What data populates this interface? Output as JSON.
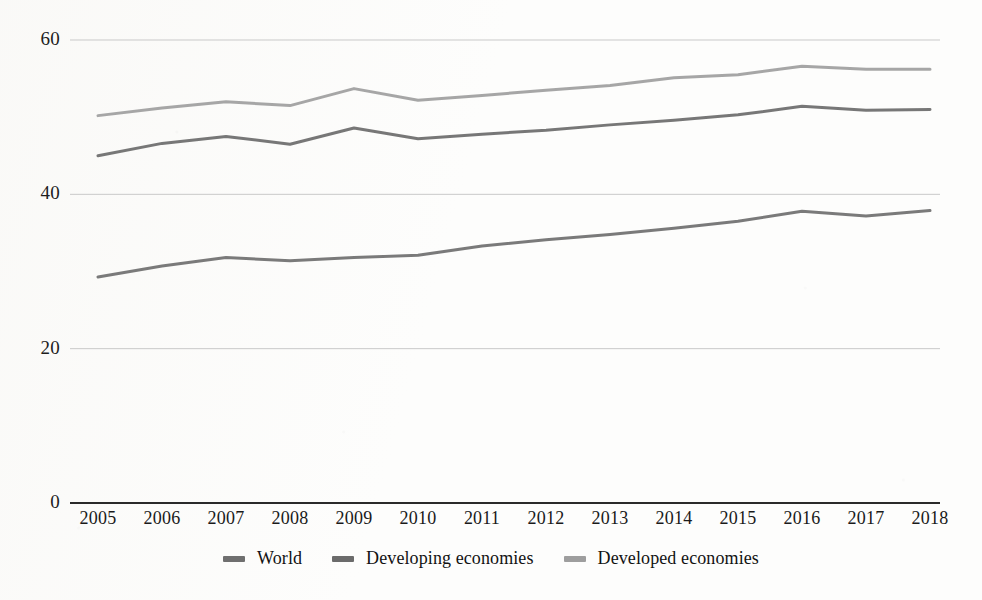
{
  "chart_data": {
    "type": "line",
    "title": "",
    "subtitle": "",
    "xlabel": "",
    "ylabel": "",
    "categories": [
      "2005",
      "2006",
      "2007",
      "2008",
      "2009",
      "2010",
      "2011",
      "2012",
      "2013",
      "2014",
      "2015",
      "2016",
      "2017",
      "2018"
    ],
    "ylim": [
      0,
      60
    ],
    "yticks": [
      0,
      20,
      40,
      60
    ],
    "ytick_labels": [
      "0",
      "20",
      "40",
      "60"
    ],
    "grid": true,
    "grid_axis": "y",
    "legend_position": "bottom",
    "series": [
      {
        "name": "World",
        "color": "#6f6f6f",
        "values": [
          29.3,
          30.7,
          31.8,
          31.4,
          31.8,
          32.1,
          33.3,
          34.1,
          34.8,
          35.6,
          36.5,
          37.8,
          37.2,
          37.9
        ]
      },
      {
        "name": "Developing economies",
        "color": "#6b6b6b",
        "values": [
          45.0,
          46.6,
          47.5,
          46.5,
          48.6,
          47.2,
          47.8,
          48.3,
          49.0,
          49.6,
          50.3,
          51.4,
          50.9,
          51.0
        ]
      },
      {
        "name": "Developed economies",
        "color": "#9e9e9e",
        "values": [
          50.2,
          51.2,
          52.0,
          51.5,
          53.7,
          52.2,
          52.8,
          53.5,
          54.1,
          55.1,
          55.5,
          56.6,
          56.2,
          56.2
        ]
      }
    ]
  },
  "axis": {
    "baseline_color": "#2a2a2a",
    "gridline_color": "#c9c9c9"
  }
}
